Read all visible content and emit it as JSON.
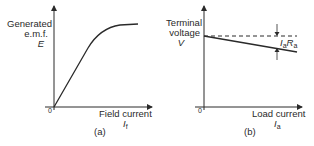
{
  "panel_a": {
    "y_label_line1": "Generated",
    "y_label_line2": "e.m.f.",
    "y_symbol": "E",
    "origin": "0",
    "x_label": "Field current",
    "x_symbol_main": "I",
    "x_symbol_sub": "f",
    "caption": "(a)",
    "curve_description": "Magnetization curve: linear rise then saturation"
  },
  "panel_b": {
    "y_label_line1": "Terminal",
    "y_label_line2": "voltage",
    "y_symbol": "V",
    "origin": "0",
    "x_label": "Load current",
    "x_symbol_main": "I",
    "x_symbol_sub": "a",
    "caption": "(b)",
    "drop_label_I": "I",
    "drop_label_a1": "a",
    "drop_label_R": "R",
    "drop_label_a2": "a",
    "curve_description": "Terminal voltage falls linearly below dashed no-load line by IaRa"
  },
  "colors": {
    "line": "#2a2a2a",
    "background": "#ffffff"
  }
}
